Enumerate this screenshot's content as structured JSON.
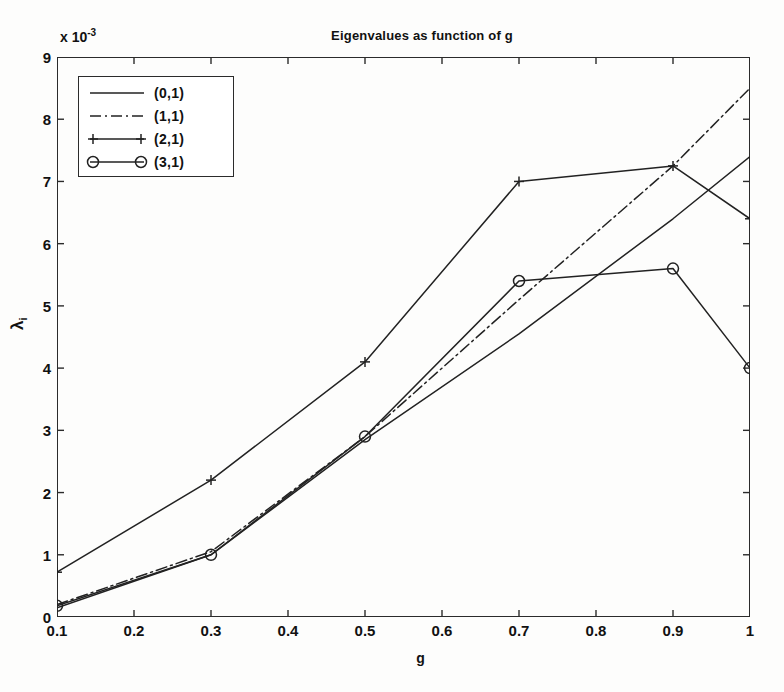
{
  "chart_data": {
    "type": "line",
    "title": "Eigenvalues as function of g",
    "xlabel": "g",
    "ylabel": "λ",
    "ylabel_sub": "i",
    "y_exponent_label": "x 10",
    "y_exponent_power": "-3",
    "y_multiplier": 0.001,
    "xlim": [
      0.1,
      1.0
    ],
    "ylim": [
      0,
      9
    ],
    "xticks": [
      "0.1",
      "0.2",
      "0.3",
      "0.4",
      "0.5",
      "0.6",
      "0.7",
      "0.8",
      "0.9",
      "1"
    ],
    "xtick_values": [
      0.1,
      0.2,
      0.3,
      0.4,
      0.5,
      0.6,
      0.7,
      0.8,
      0.9,
      1.0
    ],
    "yticks": [
      "0",
      "1",
      "2",
      "3",
      "4",
      "5",
      "6",
      "7",
      "8",
      "9"
    ],
    "ytick_values": [
      0,
      1,
      2,
      3,
      4,
      5,
      6,
      7,
      8,
      9
    ],
    "grid": false,
    "legend_position": "upper left",
    "x": [
      0.1,
      0.3,
      0.5,
      0.7,
      0.9,
      1.0
    ],
    "series": [
      {
        "name": "(0,1)",
        "style": "solid",
        "marker": "none",
        "color": "#222222",
        "values": [
          0.15,
          1.0,
          2.85,
          4.55,
          6.4,
          7.4
        ]
      },
      {
        "name": "(1,1)",
        "style": "dashdot",
        "marker": "none",
        "color": "#222222",
        "values": [
          0.2,
          1.05,
          2.9,
          5.1,
          7.25,
          8.5
        ]
      },
      {
        "name": "(2,1)",
        "style": "solid",
        "marker": "plus",
        "color": "#222222",
        "values": [
          0.72,
          2.2,
          4.1,
          7.0,
          7.25,
          6.4
        ]
      },
      {
        "name": "(3,1)",
        "style": "solid",
        "marker": "circle",
        "color": "#222222",
        "values": [
          0.18,
          1.0,
          2.9,
          5.4,
          5.6,
          4.0
        ]
      }
    ]
  },
  "legend": {
    "entries": [
      {
        "label": "(0,1)",
        "style": "solid",
        "marker": "none"
      },
      {
        "label": "(1,1)",
        "style": "dashdot",
        "marker": "none"
      },
      {
        "label": "(2,1)",
        "style": "solid",
        "marker": "plus"
      },
      {
        "label": "(3,1)",
        "style": "solid",
        "marker": "circle"
      }
    ]
  },
  "colors": {
    "axis": "#2b2b2b",
    "line": "#222222",
    "background": "#fdfdfc"
  }
}
